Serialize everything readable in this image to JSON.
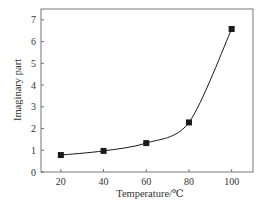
{
  "chart_data": {
    "type": "line",
    "title": "",
    "xlabel": "Temperature/℃",
    "ylabel": "Imaginary part",
    "x": [
      20,
      40,
      60,
      80,
      100
    ],
    "series": [
      {
        "name": "Imaginary part",
        "values": [
          0.78,
          0.97,
          1.33,
          2.28,
          6.58
        ],
        "marker": "square",
        "color": "#1a1a1a"
      }
    ],
    "xlim": [
      10.7,
      110
    ],
    "ylim": [
      0,
      7.5
    ],
    "xticks": [
      20,
      40,
      60,
      80,
      100
    ],
    "yticks": [
      0,
      1,
      2,
      3,
      4,
      5,
      6,
      7
    ],
    "grid": false,
    "legend": null
  },
  "colors": {
    "axis": "#555555",
    "line": "#1a1a1a",
    "text": "#333333"
  }
}
